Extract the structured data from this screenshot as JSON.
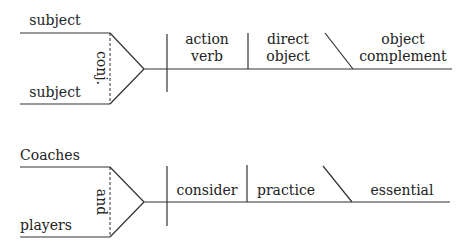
{
  "diagrams": [
    {
      "name": "template",
      "subjects": [
        "subject",
        "subject"
      ],
      "conjunction": "conj.",
      "verb": [
        "action",
        "verb"
      ],
      "direct_object": [
        "direct",
        "object"
      ],
      "object_complement": [
        "object",
        "complement"
      ]
    },
    {
      "name": "example",
      "subjects": [
        "Coaches",
        "players"
      ],
      "conjunction": "and",
      "verb": [
        "consider"
      ],
      "direct_object": [
        "practice"
      ],
      "object_complement": [
        "essential"
      ]
    }
  ],
  "colors": {
    "line": "#333333",
    "text": "#222222",
    "background": "#ffffff"
  }
}
